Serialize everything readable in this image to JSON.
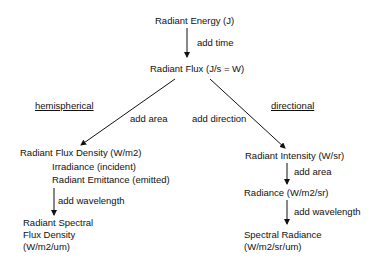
{
  "diagram": {
    "nodes": {
      "energy": "Radiant Energy (J)",
      "flux": "Radiant Flux (J/s = W)",
      "flux_density": "Radiant Flux Density (W/m2)",
      "irradiance": "Irradiance (incident)",
      "emittance": "Radiant Emittance (emitted)",
      "spectral_flux_density": [
        "Radiant Spectral",
        "Flux Density",
        "(W/m2/um)"
      ],
      "intensity": "Radiant Intensity (W/sr)",
      "radiance": "Radiance (W/m2/sr)",
      "spectral_radiance": [
        "Spectral Radiance",
        "(W/m2/sr/um)"
      ]
    },
    "edges": {
      "add_time": "add time",
      "add_area_left": "add area",
      "add_direction": "add direction",
      "add_wavelength_left": "add wavelength",
      "add_area_right": "add area",
      "add_wavelength_right": "add wavelength"
    },
    "branch_labels": {
      "left": "hemispherical",
      "right": "directional"
    }
  }
}
